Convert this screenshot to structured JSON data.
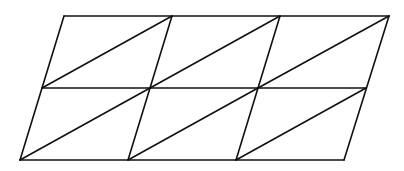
{
  "figure": {
    "type": "parallelogram-triangulation",
    "rows": 2,
    "cols": 3,
    "triangles": 12,
    "line_color": "#111111",
    "background": "#ffffff",
    "vertices": {
      "top": [
        [
          64,
          16
        ],
        [
          172,
          16
        ],
        [
          280,
          16
        ],
        [
          389,
          16
        ]
      ],
      "middle": [
        [
          42,
          88
        ],
        [
          150,
          88
        ],
        [
          258,
          88
        ],
        [
          366,
          88
        ]
      ],
      "bottom": [
        [
          20,
          160
        ],
        [
          128,
          160
        ],
        [
          236,
          160
        ],
        [
          344,
          160
        ]
      ]
    }
  }
}
